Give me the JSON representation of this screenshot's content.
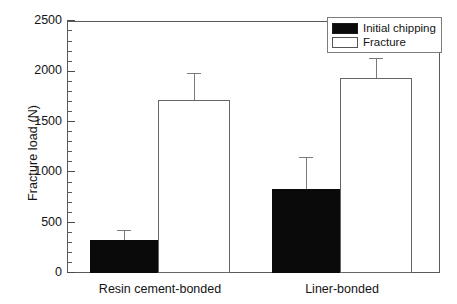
{
  "chart_data": {
    "type": "bar",
    "title": "",
    "xlabel": "",
    "ylabel": "Fracture load (N)",
    "categories": [
      "Resin cement-bonded",
      "Liner-bonded"
    ],
    "series": [
      {
        "name": "Initial chipping",
        "color": "#0a0a0a",
        "style": "filled",
        "values": [
          330,
          835
        ],
        "errors": [
          100,
          315
        ]
      },
      {
        "name": "Fracture",
        "color": "#ffffff",
        "style": "hollow",
        "values": [
          1715,
          1935
        ],
        "errors": [
          270,
          195
        ]
      }
    ],
    "ylim": [
      0,
      2500
    ],
    "yticks": [
      0,
      500,
      1000,
      1500,
      2000,
      2500
    ],
    "ytick_labels": [
      "0",
      "500",
      "1000",
      "1500",
      "2000",
      "2500"
    ],
    "y_minor_tick_interval": 100,
    "grid": false,
    "legend_position": "top-right",
    "error_bar_style": "upper-only"
  },
  "axis": {
    "y_title": "Fracture load (N)",
    "tick_labels": [
      "2500",
      "2000",
      "1500",
      "1000",
      "500",
      "0"
    ],
    "x_labels": [
      "Resin cement-bonded",
      "Liner-bonded"
    ]
  },
  "legend": {
    "entries": [
      {
        "label": "Initial chipping",
        "swatch": "filled-black-square"
      },
      {
        "label": "Fracture",
        "swatch": "hollow-white-square"
      }
    ]
  }
}
